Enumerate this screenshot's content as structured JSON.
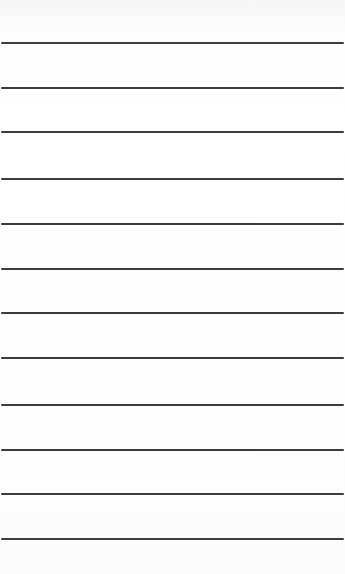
{
  "paper": {
    "background": "#ffffff",
    "rule_color": "#2b2b2b",
    "rule_count": 12,
    "rules_y": [
      43,
      88,
      132,
      179,
      224,
      269,
      313,
      358,
      405,
      450,
      494,
      539
    ]
  }
}
